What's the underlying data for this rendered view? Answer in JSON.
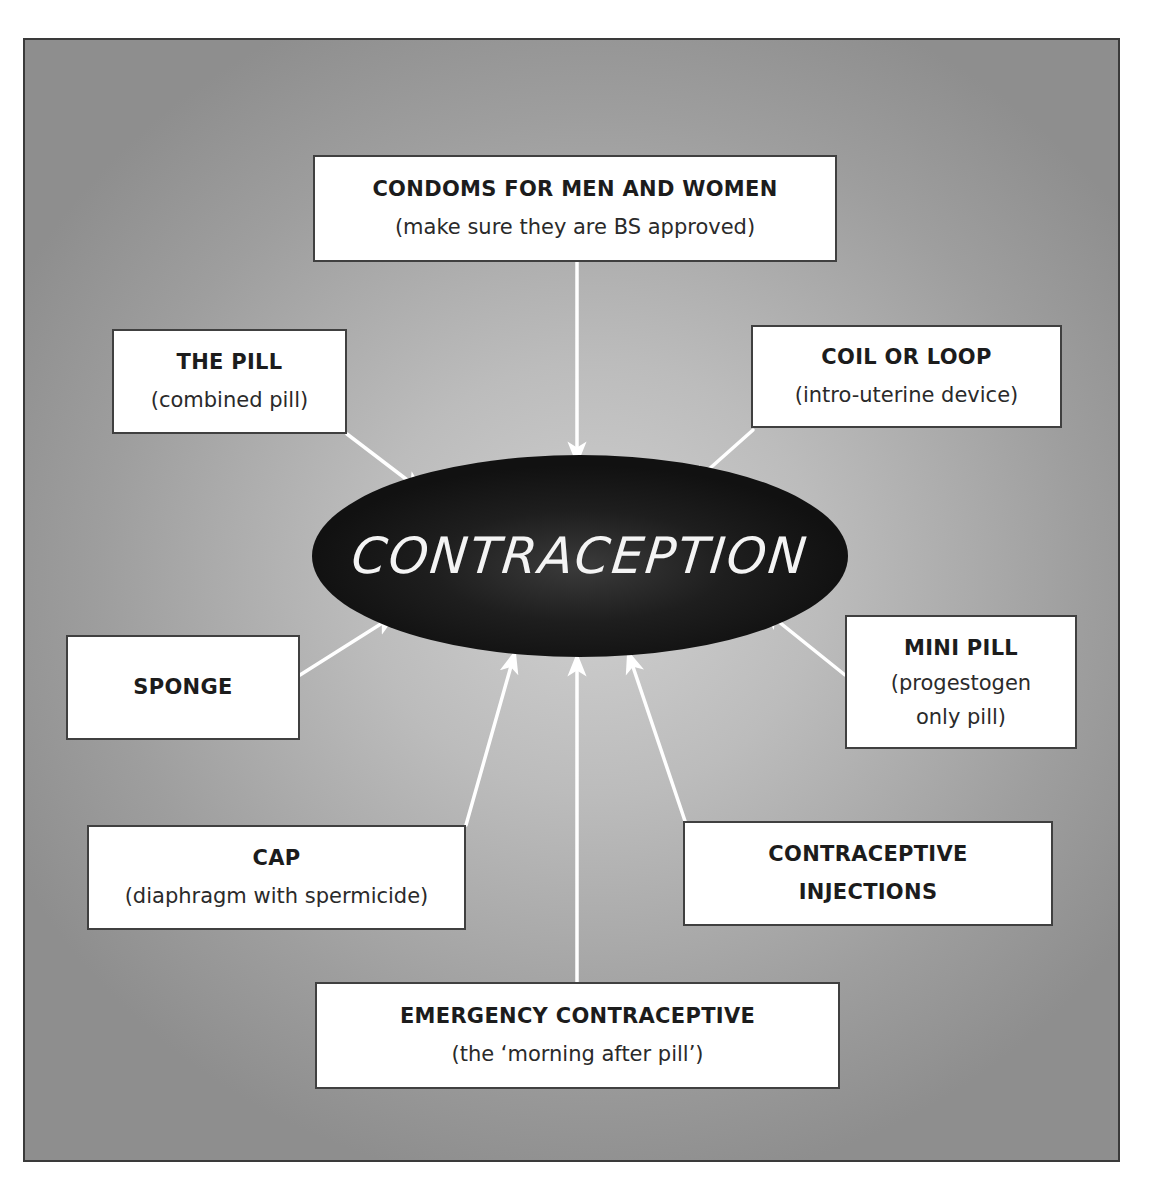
{
  "diagram": {
    "center": {
      "label": "CONTRACEPTION"
    },
    "colors": {
      "background_light": "#d0d0d0",
      "background_dark": "#8e8e8e",
      "hub_fill": "#151515",
      "hub_text": "#f4f4f4",
      "box_fill": "#ffffff",
      "box_border": "#404040",
      "arrow": "#ffffff"
    },
    "methods": [
      {
        "id": "condoms",
        "title": "CONDOMS FOR MEN AND WOMEN",
        "subtitle": "(make sure they are BS approved)"
      },
      {
        "id": "the-pill",
        "title": "THE PILL",
        "subtitle": "(combined pill)"
      },
      {
        "id": "coil",
        "title": "COIL OR LOOP",
        "subtitle": "(intro-uterine device)"
      },
      {
        "id": "sponge",
        "title": "SPONGE",
        "subtitle": ""
      },
      {
        "id": "mini-pill",
        "title": "MINI PILL",
        "subtitle_line1": "(progestogen",
        "subtitle_line2": "only pill)"
      },
      {
        "id": "cap",
        "title": "CAP",
        "subtitle": "(diaphragm with spermicide)"
      },
      {
        "id": "injections",
        "title_line1": "CONTRACEPTIVE",
        "title_line2": "INJECTIONS"
      },
      {
        "id": "emergency",
        "title": "EMERGENCY CONTRACEPTIVE",
        "subtitle": "(the ‘morning after pill’)"
      }
    ],
    "edges": [
      {
        "from": "condoms",
        "to": "center"
      },
      {
        "from": "the-pill",
        "to": "center"
      },
      {
        "from": "coil",
        "to": "center"
      },
      {
        "from": "sponge",
        "to": "center"
      },
      {
        "from": "mini-pill",
        "to": "center"
      },
      {
        "from": "cap",
        "to": "center"
      },
      {
        "from": "injections",
        "to": "center"
      },
      {
        "from": "emergency",
        "to": "center"
      }
    ]
  }
}
